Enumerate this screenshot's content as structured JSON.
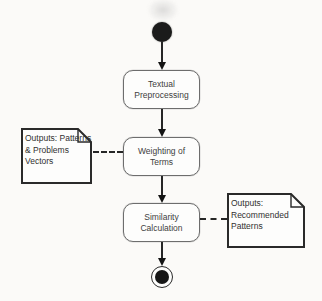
{
  "diagram": {
    "type": "uml-activity-diagram",
    "activities": [
      {
        "id": "textual-preprocessing",
        "lines": [
          "Textual",
          "Preprocessing"
        ]
      },
      {
        "id": "weighting-of-terms",
        "lines": [
          "Weighting  of",
          "Terms"
        ]
      },
      {
        "id": "similarity-calculation",
        "lines": [
          "Similarity",
          "Calculation"
        ]
      }
    ],
    "notes": [
      {
        "id": "outputs-patterns-problems-vectors",
        "lines": [
          "Outputs: Patterns",
          "& Problems",
          "Vectors"
        ]
      },
      {
        "id": "outputs-recommended-patterns",
        "lines": [
          "Outputs:",
          "Recommended",
          "Patterns"
        ]
      }
    ],
    "terminals": {
      "start": "initial-node",
      "end": "activity-final-node"
    },
    "colors": {
      "background": "#fbfaf8",
      "box_fill": "#fdfdfc",
      "box_border": "#6d6d6d",
      "note_border": "#2a2a2a",
      "text": "#3d3d3d",
      "connector": "#262626",
      "node_fill": "#1b1b1b"
    }
  }
}
